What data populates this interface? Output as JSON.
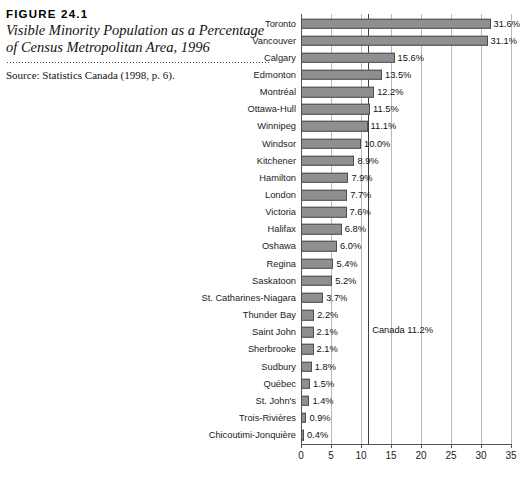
{
  "caption": {
    "figure_number": "FIGURE 24.1",
    "title": "Visible Minority Population as a Percentage of Census Metropolitan Area, 1996",
    "source": "Source: Statistics Canada (1998, p. 6)."
  },
  "chart_data": {
    "type": "bar",
    "orientation": "horizontal",
    "title": "Visible Minority Population as a Percentage of Census Metropolitan Area, 1996",
    "xlabel": "",
    "ylabel": "",
    "xlim": [
      0,
      35
    ],
    "xticks": [
      "0",
      "5",
      "10",
      "15",
      "20",
      "25",
      "30",
      "35"
    ],
    "grid": "vertical",
    "legend": "none",
    "value_suffix": "%",
    "categories": [
      "Toronto",
      "Vancouver",
      "Calgary",
      "Edmonton",
      "Montréal",
      "Ottawa-Hull",
      "Winnipeg",
      "Windsor",
      "Kitchener",
      "Hamilton",
      "London",
      "Victoria",
      "Halifax",
      "Oshawa",
      "Regina",
      "Saskatoon",
      "St. Catharines-Niagara",
      "Thunder Bay",
      "Saint John",
      "Sherbrooke",
      "Sudbury",
      "Québec",
      "St. John's",
      "Trois-Rivières",
      "Chicoutimi-Jonquière"
    ],
    "values": [
      31.6,
      31.1,
      15.6,
      13.5,
      12.2,
      11.5,
      11.1,
      10.0,
      8.9,
      7.9,
      7.7,
      7.6,
      6.8,
      6.0,
      5.4,
      5.2,
      3.7,
      2.2,
      2.1,
      2.1,
      1.8,
      1.5,
      1.4,
      0.9,
      0.4
    ],
    "data_labels": [
      "31.6%",
      "31.1%",
      "15.6%",
      "13.5%",
      "12.2%",
      "11.5%",
      "11.1%",
      "10.0%",
      "8.9%",
      "7.9%",
      "7.7%",
      "7.6%",
      "6.8%",
      "6.0%",
      "5.4%",
      "5.2%",
      "3.7%",
      "2.2%",
      "2.1%",
      "2.1%",
      "1.8%",
      "1.5%",
      "1.4%",
      "0.9%",
      "0.4%"
    ],
    "annotations": [
      {
        "label": "Canada 11.2%",
        "value": 11.2,
        "kind": "reference-line"
      }
    ],
    "colors": {
      "bar_fill": "#8f8f8f",
      "bar_stroke": "#4d4d4d",
      "gridline": "#b9b9b9",
      "axis": "#555555",
      "reference_line": "#3d3d3d",
      "text": "#1b1b1b"
    }
  }
}
